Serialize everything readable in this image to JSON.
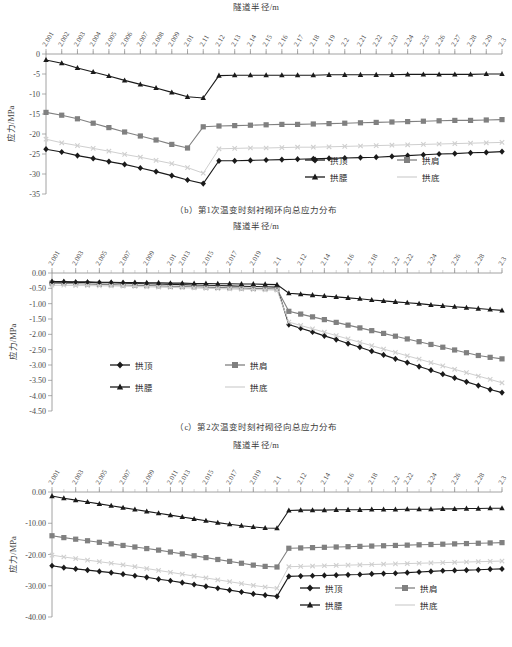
{
  "page": {
    "background": "#ffffff",
    "colors": {
      "series_gongding": "#1a1a1a",
      "series_gongjian": "#808080",
      "series_gongyao": "#1a1a1a",
      "series_gongdi": "#cfcfcf",
      "axis": "#8c8c8c",
      "text": "#3a3a3a"
    }
  },
  "figures": [
    {
      "id": "fig-b",
      "caption": "（b）第1次温变时刻衬砌环向总应力分布",
      "chart_data": {
        "type": "line",
        "title": "",
        "xlabel": "隧道半径/m",
        "ylabel": "应力/MPa",
        "ylim": [
          -35,
          0
        ],
        "yticks": [
          "0",
          "-5",
          "-10",
          "-15",
          "-20",
          "-25",
          "-30",
          "-35"
        ],
        "ytick_values": [
          0,
          -5,
          -10,
          -15,
          -20,
          -25,
          -30,
          -35
        ],
        "grid": false,
        "legend_position": "bottom-right",
        "x": [
          2.001,
          2.002,
          2.003,
          2.004,
          2.005,
          2.006,
          2.007,
          2.008,
          2.009,
          2.01,
          2.11,
          2.12,
          2.13,
          2.14,
          2.15,
          2.16,
          2.17,
          2.18,
          2.19,
          2.2,
          2.21,
          2.22,
          2.23,
          2.24,
          2.25,
          2.26,
          2.27,
          2.28,
          2.29,
          2.3
        ],
        "xtick_labels": [
          "2.001",
          "2.002",
          "2.003",
          "2.004",
          "2.005",
          "2.006",
          "2.007",
          "2.008",
          "2.009",
          "2.01",
          "2.11",
          "2.12",
          "2.13",
          "2.14",
          "2.15",
          "2.16",
          "2.17",
          "2.18",
          "2.19",
          "2.2",
          "2.21",
          "2.22",
          "2.23",
          "2.24",
          "2.25",
          "2.26",
          "2.27",
          "2.28",
          "2.29",
          "2.3"
        ],
        "series": [
          {
            "name": "拱顶",
            "marker": "diamond",
            "color": "#1a1a1a",
            "values": [
              -23.8,
              -24.5,
              -25.4,
              -26.1,
              -26.9,
              -27.6,
              -28.5,
              -29.4,
              -30.4,
              -31.5,
              -32.4,
              -26.7,
              -26.7,
              -26.6,
              -26.5,
              -26.4,
              -26.3,
              -26.2,
              -26.1,
              -26.0,
              -25.9,
              -25.8,
              -25.6,
              -25.4,
              -25.2,
              -25.0,
              -24.9,
              -24.7,
              -24.6,
              -24.4
            ]
          },
          {
            "name": "拱肩",
            "marker": "square",
            "color": "#808080",
            "values": [
              -14.6,
              -15.3,
              -16.2,
              -17.3,
              -18.4,
              -19.5,
              -20.5,
              -21.5,
              -22.6,
              -23.5,
              -18.2,
              -18.0,
              -17.9,
              -17.8,
              -17.7,
              -17.6,
              -17.6,
              -17.5,
              -17.4,
              -17.3,
              -17.2,
              -17.1,
              -17.0,
              -16.9,
              -16.8,
              -16.7,
              -16.6,
              -16.6,
              -16.5,
              -16.4
            ]
          },
          {
            "name": "拱腰",
            "marker": "triangle",
            "color": "#1a1a1a",
            "values": [
              -1.5,
              -2.3,
              -3.5,
              -4.5,
              -5.5,
              -6.6,
              -7.6,
              -8.5,
              -9.6,
              -10.7,
              -11.0,
              -5.4,
              -5.3,
              -5.3,
              -5.3,
              -5.3,
              -5.3,
              -5.3,
              -5.2,
              -5.2,
              -5.2,
              -5.2,
              -5.2,
              -5.1,
              -5.1,
              -5.1,
              -5.1,
              -5.1,
              -5.0,
              -5.0
            ]
          },
          {
            "name": "拱底",
            "marker": "cross",
            "color": "#cfcfcf",
            "values": [
              -21.3,
              -22.2,
              -22.9,
              -23.6,
              -24.3,
              -25.1,
              -25.8,
              -26.6,
              -27.4,
              -28.4,
              -29.8,
              -23.7,
              -23.6,
              -23.5,
              -23.5,
              -23.4,
              -23.3,
              -23.3,
              -23.2,
              -23.1,
              -23.0,
              -22.9,
              -22.8,
              -22.7,
              -22.6,
              -22.5,
              -22.4,
              -22.3,
              -22.2,
              -22.1
            ]
          }
        ]
      }
    },
    {
      "id": "fig-c",
      "caption": "（c）第2次温变时刻衬砌径向总应力分布",
      "chart_data": {
        "type": "line",
        "title": "",
        "xlabel": "隧道半径/m",
        "ylabel": "应力/MPa",
        "ylim": [
          -4.5,
          0
        ],
        "yticks": [
          "0.00",
          "-0.50",
          "-1.00",
          "-1.50",
          "-2.00",
          "-2.50",
          "-3.00",
          "-3.50",
          "-4.00",
          "-4.50"
        ],
        "ytick_values": [
          0,
          -0.5,
          -1,
          -1.5,
          -2,
          -2.5,
          -3,
          -3.5,
          -4,
          -4.5
        ],
        "grid": false,
        "legend_position": "center-left",
        "xtick_labels": [
          "2.001",
          "2.003",
          "2.005",
          "2.007",
          "2.009",
          "2.01",
          "2.013",
          "2.015",
          "2.017",
          "2.019",
          "2.1",
          "2.12",
          "2.14",
          "2.16",
          "2.18",
          "2.2",
          "2.22",
          "2.24",
          "2.26",
          "2.28",
          "2.3"
        ],
        "series": [
          {
            "name": "拱顶",
            "marker": "diamond",
            "color": "#1a1a1a",
            "values": [
              -0.3,
              -0.3,
              -0.31,
              -0.31,
              -0.32,
              -0.32,
              -0.33,
              -0.34,
              -0.35,
              -0.36,
              -0.37,
              -0.38,
              -0.39,
              -0.4,
              -0.41,
              -0.42,
              -0.43,
              -0.44,
              -0.45,
              -0.46,
              -1.68,
              -1.8,
              -1.92,
              -2.05,
              -2.17,
              -2.3,
              -2.42,
              -2.55,
              -2.67,
              -2.8,
              -2.92,
              -3.05,
              -3.17,
              -3.3,
              -3.42,
              -3.55,
              -3.67,
              -3.8,
              -3.9
            ]
          },
          {
            "name": "拱肩",
            "marker": "square",
            "color": "#808080",
            "values": [
              -0.33,
              -0.34,
              -0.35,
              -0.36,
              -0.37,
              -0.38,
              -0.39,
              -0.4,
              -0.41,
              -0.42,
              -0.43,
              -0.44,
              -0.45,
              -0.46,
              -0.47,
              -0.48,
              -0.49,
              -0.5,
              -0.51,
              -0.52,
              -1.25,
              -1.34,
              -1.43,
              -1.52,
              -1.61,
              -1.7,
              -1.79,
              -1.88,
              -1.97,
              -2.06,
              -2.15,
              -2.24,
              -2.33,
              -2.42,
              -2.51,
              -2.6,
              -2.69,
              -2.75,
              -2.8
            ]
          },
          {
            "name": "拱腰",
            "marker": "triangle",
            "color": "#1a1a1a",
            "values": [
              -0.28,
              -0.28,
              -0.29,
              -0.29,
              -0.3,
              -0.3,
              -0.31,
              -0.31,
              -0.32,
              -0.32,
              -0.33,
              -0.33,
              -0.34,
              -0.34,
              -0.35,
              -0.35,
              -0.36,
              -0.36,
              -0.37,
              -0.38,
              -0.66,
              -0.69,
              -0.72,
              -0.75,
              -0.78,
              -0.81,
              -0.84,
              -0.88,
              -0.91,
              -0.94,
              -0.97,
              -1.0,
              -1.04,
              -1.07,
              -1.1,
              -1.13,
              -1.16,
              -1.19,
              -1.22
            ]
          },
          {
            "name": "拱底",
            "marker": "cross",
            "color": "#cfcfcf",
            "values": [
              -0.4,
              -0.4,
              -0.41,
              -0.41,
              -0.42,
              -0.42,
              -0.43,
              -0.44,
              -0.45,
              -0.46,
              -0.47,
              -0.48,
              -0.49,
              -0.5,
              -0.51,
              -0.52,
              -0.53,
              -0.54,
              -0.55,
              -0.56,
              -1.6,
              -1.71,
              -1.82,
              -1.93,
              -2.04,
              -2.15,
              -2.26,
              -2.37,
              -2.48,
              -2.59,
              -2.7,
              -2.81,
              -2.92,
              -3.03,
              -3.14,
              -3.25,
              -3.36,
              -3.47,
              -3.58
            ]
          }
        ]
      }
    },
    {
      "id": "fig-d",
      "caption": "",
      "chart_data": {
        "type": "line",
        "title": "",
        "xlabel": "隧道半径/m",
        "ylabel": "应力/MPa",
        "ylim": [
          -40,
          0
        ],
        "yticks": [
          "0.00",
          "-10.00",
          "-20.00",
          "-30.00",
          "-40.00"
        ],
        "ytick_values": [
          0,
          -10,
          -20,
          -30,
          -40
        ],
        "grid": false,
        "legend_position": "bottom-right",
        "xtick_labels": [
          "2.001",
          "2.003",
          "2.005",
          "2.007",
          "2.009",
          "2.011",
          "2.013",
          "2.015",
          "2.017",
          "2.019",
          "2.1",
          "2.12",
          "2.14",
          "2.16",
          "2.18",
          "2.2",
          "2.22",
          "2.24",
          "2.26",
          "2.28",
          "2.3"
        ],
        "series": [
          {
            "name": "拱顶",
            "marker": "diamond",
            "color": "#1a1a1a",
            "values": [
              -23.6,
              -24.2,
              -24.6,
              -25.0,
              -25.4,
              -25.8,
              -26.3,
              -26.8,
              -27.3,
              -27.9,
              -28.4,
              -29.0,
              -29.6,
              -30.2,
              -30.8,
              -31.4,
              -32.0,
              -32.6,
              -33.0,
              -33.4,
              -27.0,
              -26.9,
              -26.8,
              -26.7,
              -26.6,
              -26.5,
              -26.4,
              -26.2,
              -26.1,
              -26.0,
              -25.8,
              -25.6,
              -25.4,
              -25.2,
              -25.1,
              -25.0,
              -24.9,
              -24.7,
              -24.6
            ]
          },
          {
            "name": "拱肩",
            "marker": "square",
            "color": "#808080",
            "values": [
              -14.0,
              -14.6,
              -15.1,
              -15.6,
              -16.1,
              -16.6,
              -17.1,
              -17.6,
              -18.1,
              -18.6,
              -19.2,
              -19.8,
              -20.4,
              -21.0,
              -21.6,
              -22.2,
              -22.8,
              -23.4,
              -23.8,
              -24.0,
              -18.0,
              -17.9,
              -17.8,
              -17.7,
              -17.6,
              -17.5,
              -17.4,
              -17.3,
              -17.2,
              -17.1,
              -17.0,
              -16.9,
              -16.8,
              -16.7,
              -16.6,
              -16.5,
              -16.4,
              -16.3,
              -16.2
            ]
          },
          {
            "name": "拱腰",
            "marker": "triangle",
            "color": "#1a1a1a",
            "values": [
              -1.3,
              -2.0,
              -2.6,
              -3.2,
              -3.8,
              -4.4,
              -5.0,
              -5.6,
              -6.2,
              -6.8,
              -7.4,
              -8.0,
              -8.6,
              -9.2,
              -9.8,
              -10.3,
              -10.8,
              -11.2,
              -11.5,
              -11.6,
              -5.9,
              -5.8,
              -5.8,
              -5.8,
              -5.7,
              -5.7,
              -5.7,
              -5.6,
              -5.6,
              -5.6,
              -5.5,
              -5.5,
              -5.5,
              -5.4,
              -5.4,
              -5.3,
              -5.3,
              -5.2,
              -5.2
            ]
          },
          {
            "name": "拱底",
            "marker": "cross",
            "color": "#cfcfcf",
            "values": [
              -20.2,
              -20.8,
              -21.3,
              -21.8,
              -22.3,
              -22.8,
              -23.3,
              -23.9,
              -24.5,
              -25.1,
              -25.7,
              -26.3,
              -26.9,
              -27.5,
              -28.1,
              -28.7,
              -29.3,
              -29.9,
              -30.4,
              -30.8,
              -23.9,
              -23.8,
              -23.7,
              -23.6,
              -23.5,
              -23.4,
              -23.3,
              -23.2,
              -23.1,
              -23.0,
              -22.9,
              -22.8,
              -22.7,
              -22.6,
              -22.5,
              -22.4,
              -22.3,
              -22.2,
              -22.1
            ]
          }
        ]
      }
    }
  ],
  "legend": {
    "items": [
      {
        "label": "拱顶",
        "marker": "diamond",
        "color": "#1a1a1a"
      },
      {
        "label": "拱肩",
        "marker": "square",
        "color": "#808080"
      },
      {
        "label": "拱腰",
        "marker": "triangle",
        "color": "#1a1a1a"
      },
      {
        "label": "拱底",
        "marker": "cross",
        "color": "#cfcfcf"
      }
    ]
  }
}
